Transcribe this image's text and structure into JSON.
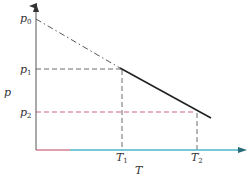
{
  "diagram": {
    "type": "p-T relation diagram",
    "axes": {
      "x_label": "T",
      "y_label": "p",
      "x_axis_color": "#4bb7c9",
      "y_axis_color": "#555555",
      "origin_color": "#c0405a"
    },
    "y_ticks": [
      {
        "main": "p",
        "sub": "0"
      },
      {
        "main": "p",
        "sub": "1"
      },
      {
        "main": "p",
        "sub": "2"
      }
    ],
    "x_ticks": [
      {
        "main": "T",
        "sub": "1"
      },
      {
        "main": "T",
        "sub": "2"
      }
    ],
    "colors": {
      "line": "#222222",
      "dash_gray": "#444444",
      "dash_red": "#c0405a"
    }
  }
}
